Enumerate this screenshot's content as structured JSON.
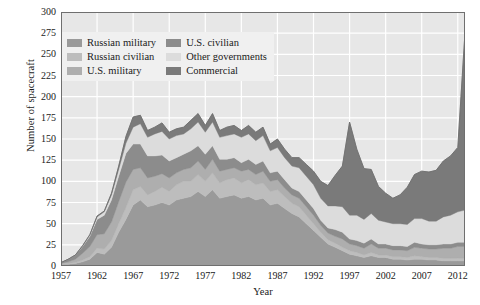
{
  "chart_data": {
    "type": "area",
    "title": "",
    "xlabel": "Year",
    "ylabel": "Number of spacecraft",
    "xlim": [
      1957,
      2013
    ],
    "ylim": [
      0,
      300
    ],
    "ytick_step": 25,
    "xtick_step": 5,
    "grid": true,
    "stacked": true,
    "legend_position": "top-left",
    "plot_background": "#e7e7e7",
    "gridline_color": "#ffffff",
    "yticks": [
      0,
      25,
      50,
      75,
      100,
      125,
      150,
      175,
      200,
      225,
      250,
      275,
      300
    ],
    "xticks": [
      1957,
      1962,
      1967,
      1972,
      1977,
      1982,
      1987,
      1992,
      1997,
      2002,
      2007,
      2012
    ],
    "x": [
      1957,
      1958,
      1959,
      1960,
      1961,
      1962,
      1963,
      1964,
      1965,
      1966,
      1967,
      1968,
      1969,
      1970,
      1971,
      1972,
      1973,
      1974,
      1975,
      1976,
      1977,
      1978,
      1979,
      1980,
      1981,
      1982,
      1983,
      1984,
      1985,
      1986,
      1987,
      1988,
      1989,
      1990,
      1991,
      1992,
      1993,
      1994,
      1995,
      1996,
      1997,
      1998,
      1999,
      2000,
      2001,
      2002,
      2003,
      2004,
      2005,
      2006,
      2007,
      2008,
      2009,
      2010,
      2011,
      2012,
      2013
    ],
    "series": [
      {
        "name": "Russian military",
        "color": "#9a9a9a",
        "values": [
          2,
          2,
          3,
          5,
          8,
          16,
          14,
          22,
          40,
          55,
          72,
          78,
          70,
          72,
          75,
          72,
          78,
          80,
          82,
          88,
          82,
          90,
          80,
          82,
          84,
          80,
          82,
          78,
          80,
          72,
          74,
          68,
          62,
          58,
          50,
          42,
          34,
          26,
          22,
          18,
          14,
          12,
          10,
          12,
          10,
          10,
          8,
          8,
          7,
          8,
          8,
          7,
          7,
          6,
          6,
          6,
          6
        ]
      },
      {
        "name": "Russian civilian",
        "color": "#bdbdbd",
        "values": [
          1,
          1,
          1,
          2,
          3,
          5,
          6,
          8,
          10,
          14,
          18,
          16,
          14,
          16,
          18,
          16,
          18,
          20,
          18,
          20,
          18,
          20,
          18,
          20,
          20,
          18,
          20,
          18,
          18,
          16,
          16,
          14,
          12,
          12,
          10,
          8,
          6,
          5,
          5,
          4,
          4,
          4,
          3,
          4,
          3,
          3,
          3,
          3,
          3,
          4,
          3,
          3,
          3,
          3,
          3,
          3,
          3
        ]
      },
      {
        "name": "U.S. military",
        "color": "#aeaeae",
        "values": [
          0,
          2,
          4,
          8,
          12,
          16,
          18,
          22,
          26,
          30,
          24,
          22,
          20,
          18,
          16,
          16,
          14,
          14,
          16,
          16,
          14,
          16,
          14,
          12,
          12,
          14,
          12,
          12,
          14,
          12,
          12,
          10,
          10,
          10,
          10,
          10,
          8,
          8,
          8,
          10,
          8,
          8,
          8,
          10,
          8,
          8,
          8,
          8,
          8,
          10,
          10,
          10,
          10,
          12,
          12,
          14,
          14
        ]
      },
      {
        "name": "U.S. civilian",
        "color": "#8c8c8c",
        "values": [
          1,
          3,
          5,
          8,
          12,
          18,
          22,
          26,
          30,
          34,
          30,
          28,
          26,
          24,
          22,
          20,
          18,
          18,
          20,
          18,
          18,
          16,
          14,
          12,
          12,
          10,
          12,
          12,
          12,
          10,
          10,
          10,
          8,
          8,
          8,
          8,
          6,
          6,
          8,
          8,
          6,
          6,
          6,
          6,
          5,
          5,
          5,
          5,
          5,
          6,
          5,
          5,
          5,
          5,
          5,
          5,
          5
        ]
      },
      {
        "name": "Other governments",
        "color": "#dcdcdc",
        "values": [
          0,
          0,
          0,
          1,
          2,
          3,
          4,
          6,
          8,
          12,
          20,
          24,
          22,
          26,
          28,
          26,
          26,
          24,
          26,
          28,
          26,
          28,
          26,
          28,
          28,
          30,
          30,
          28,
          30,
          26,
          28,
          26,
          26,
          28,
          28,
          28,
          26,
          26,
          28,
          30,
          28,
          30,
          28,
          30,
          28,
          26,
          26,
          26,
          26,
          28,
          30,
          28,
          28,
          32,
          34,
          36,
          38
        ]
      },
      {
        "name": "Commercial",
        "color": "#7a7a7a",
        "values": [
          0,
          0,
          0,
          0,
          0,
          1,
          1,
          2,
          4,
          8,
          12,
          10,
          8,
          8,
          10,
          8,
          8,
          8,
          10,
          10,
          8,
          10,
          8,
          10,
          10,
          8,
          10,
          10,
          10,
          8,
          10,
          10,
          10,
          12,
          14,
          16,
          20,
          24,
          36,
          48,
          110,
          78,
          60,
          52,
          40,
          34,
          30,
          34,
          44,
          52,
          56,
          58,
          60,
          66,
          70,
          76,
          210
        ]
      }
    ],
    "totals_note": "stacked totals peak near 175 in 1966-1967 and spike to about 280 in the final year"
  },
  "legend": {
    "items": [
      {
        "label": "Russian military",
        "color": "#9a9a9a"
      },
      {
        "label": "U.S. civilian",
        "color": "#8c8c8c"
      },
      {
        "label": "Russian civilian",
        "color": "#bdbdbd"
      },
      {
        "label": "Other governments",
        "color": "#dcdcdc"
      },
      {
        "label": "U.S. military",
        "color": "#aeaeae"
      },
      {
        "label": "Commercial",
        "color": "#7a7a7a"
      }
    ]
  }
}
